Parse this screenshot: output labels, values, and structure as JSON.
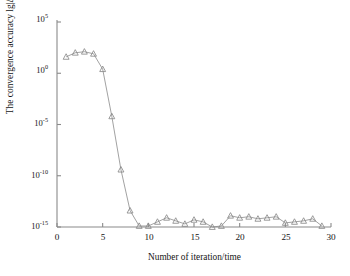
{
  "chart_data": {
    "type": "line",
    "title": "",
    "subtitle": "",
    "xlabel": "Number of iteration/time",
    "ylabel": "The convergence accuracy lg|Δx|",
    "xlim": [
      0,
      30
    ],
    "ylim_exponents": [
      -15,
      5
    ],
    "yscale": "log",
    "grid": false,
    "legend": null,
    "marker": "triangle-up",
    "line_color": "#8a8a8a",
    "marker_color": "#8a8a8a",
    "axis_color": "#8a8a8a",
    "xticks": [
      0,
      5,
      10,
      15,
      20,
      25,
      30
    ],
    "xtick_labels": [
      "0",
      "5",
      "10",
      "15",
      "20",
      "25",
      "30"
    ],
    "ytick_exponents": [
      5,
      0,
      -5,
      -10,
      -15
    ],
    "ytick_labels": [
      "10",
      "10",
      "10",
      "10",
      "10"
    ],
    "ytick_exponent_labels": [
      "5",
      "0",
      "-5",
      "-10",
      "-15"
    ],
    "series": [
      {
        "name": "convergence accuracy",
        "x": [
          1,
          2,
          3,
          4,
          5,
          6,
          7,
          8,
          9,
          10,
          11,
          12,
          13,
          14,
          15,
          16,
          17,
          18,
          19,
          20,
          21,
          22,
          23,
          24,
          25,
          26,
          27,
          28,
          29
        ],
        "y_exponents": [
          1.6,
          2.0,
          2.1,
          1.9,
          0.4,
          -4.2,
          -9.4,
          -13.4,
          -14.9,
          -14.9,
          -14.5,
          -14.1,
          -14.4,
          -14.7,
          -14.3,
          -14.5,
          -15.0,
          -14.9,
          -13.9,
          -14.1,
          -14.0,
          -14.2,
          -14.1,
          -14.0,
          -14.6,
          -14.5,
          -14.4,
          -14.2,
          -14.9
        ]
      }
    ]
  },
  "axis": {
    "xlabel": "Number of iteration/time",
    "ylabel": "The convergence accuracy lg|Δx|"
  }
}
